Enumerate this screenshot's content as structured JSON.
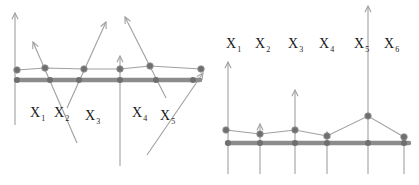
{
  "colors": {
    "line": "#8a8a8a",
    "thin_line": "#a0a0a0",
    "baseline": "#8c8c8c",
    "dot": "#6f6f6f",
    "text": "#1a1a1a"
  },
  "panels": [
    {
      "name": "left-panel",
      "labels": [
        {
          "base": "X",
          "sub": "1",
          "x": 30,
          "y": 117
        },
        {
          "base": "X",
          "sub": "2",
          "x": 54,
          "y": 117
        },
        {
          "base": "X",
          "sub": "3",
          "x": 85,
          "y": 120
        },
        {
          "base": "X",
          "sub": "4",
          "x": 132,
          "y": 117
        },
        {
          "base": "X",
          "sub": "5",
          "x": 160,
          "y": 120
        }
      ],
      "baseline": {
        "x1": 16,
        "x2": 200,
        "y": 80
      },
      "bottom_nodes": [
        [
          17,
          80
        ],
        [
          50,
          80
        ],
        [
          79,
          80
        ],
        [
          120,
          80
        ],
        [
          156,
          80
        ],
        [
          193,
          80
        ]
      ],
      "top_polyline": [
        [
          17,
          70
        ],
        [
          45,
          68
        ],
        [
          84,
          69
        ],
        [
          120,
          69
        ],
        [
          150,
          66
        ],
        [
          201,
          69
        ]
      ],
      "arrows": [
        {
          "from": [
            15,
            125
          ],
          "to": [
            15,
            13
          ]
        },
        {
          "from": [
            77,
            143
          ],
          "to": [
            33,
            42
          ]
        },
        {
          "from": [
            67,
            108
          ],
          "to": [
            106,
            22
          ]
        },
        {
          "from": [
            120,
            166
          ],
          "to": [
            120,
            56
          ]
        },
        {
          "from": [
            166,
            98
          ],
          "to": [
            125,
            17
          ]
        },
        {
          "from": [
            147,
            155
          ],
          "to": [
            203,
            73
          ]
        }
      ]
    },
    {
      "name": "right-panel",
      "labels": [
        {
          "base": "X",
          "sub": "1",
          "x": 226,
          "y": 48
        },
        {
          "base": "X",
          "sub": "2",
          "x": 255,
          "y": 48
        },
        {
          "base": "X",
          "sub": "3",
          "x": 288,
          "y": 48
        },
        {
          "base": "X",
          "sub": "4",
          "x": 319,
          "y": 48
        },
        {
          "base": "X",
          "sub": "5",
          "x": 354,
          "y": 48
        },
        {
          "base": "X",
          "sub": "6",
          "x": 384,
          "y": 48
        }
      ],
      "baseline": {
        "x1": 227,
        "x2": 409,
        "y": 143
      },
      "bottom_nodes": [
        [
          228,
          143
        ],
        [
          260,
          143
        ],
        [
          295,
          143
        ],
        [
          327,
          143
        ],
        [
          368,
          143
        ],
        [
          404,
          143
        ]
      ],
      "top_polyline": [
        [
          226,
          130
        ],
        [
          260,
          134
        ],
        [
          295,
          130
        ],
        [
          327,
          136
        ],
        [
          368,
          116
        ],
        [
          404,
          137
        ]
      ],
      "arrows": [
        {
          "from": [
            228,
            174
          ],
          "to": [
            228,
            62
          ]
        },
        {
          "from": [
            260,
            174
          ],
          "to": [
            260,
            124
          ]
        },
        {
          "from": [
            295,
            174
          ],
          "to": [
            295,
            90
          ]
        },
        {
          "from": [
            327,
            174
          ],
          "to": [
            327,
            132
          ]
        },
        {
          "from": [
            368,
            174
          ],
          "to": [
            368,
            6
          ]
        },
        {
          "from": [
            404,
            174
          ],
          "to": [
            404,
            139
          ]
        }
      ]
    }
  ]
}
